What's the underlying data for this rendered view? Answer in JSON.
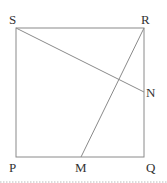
{
  "diagram": {
    "type": "geometry-square",
    "points": {
      "S": {
        "label": "S",
        "x": 16,
        "y": 28
      },
      "R": {
        "label": "R",
        "x": 144,
        "y": 28
      },
      "Q": {
        "label": "Q",
        "x": 144,
        "y": 157
      },
      "P": {
        "label": "P",
        "x": 16,
        "y": 157
      },
      "N": {
        "label": "N",
        "x": 144,
        "y": 92
      },
      "M": {
        "label": "M",
        "x": 81,
        "y": 157
      }
    },
    "segments": [
      {
        "from": "S",
        "to": "N"
      },
      {
        "from": "R",
        "to": "M"
      }
    ],
    "colors": {
      "line": "#8a8a8a",
      "label": "#333333",
      "divider": "#b8b8b8"
    }
  }
}
